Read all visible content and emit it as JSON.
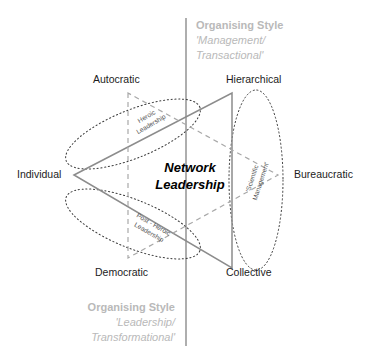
{
  "diagram": {
    "center_title_line1": "Network",
    "center_title_line2": "Leadership",
    "axis_top": {
      "title": "Organising Style",
      "sub_line1": "'Management/",
      "sub_line2": "Transactional'"
    },
    "axis_bottom": {
      "title": "Organising Style",
      "sub_line1": "'Leadership/",
      "sub_line2": "Transformational'"
    },
    "corner_labels": {
      "top_left": "Autocratic",
      "top_right": "Hierarchical",
      "left": "Individual",
      "right": "Bureaucratic",
      "bottom_left": "Democratic",
      "bottom_right": "Collective"
    },
    "region_labels": {
      "upper": {
        "line1": "Heroic",
        "line2": "Leadership"
      },
      "lower": {
        "line1": "Post - Heroic",
        "line2": "Leadership"
      },
      "right": {
        "line1": "'Scientific",
        "line2": "Management'"
      }
    },
    "colors": {
      "solid_triangle": "#8c8c8c",
      "dashed_triangle": "#a8a8a8",
      "dotted_ellipse": "#3a3a3a",
      "axis_line": "#9a9a9a",
      "axis_text": "#b9b9b9",
      "label_text": "#1c1c1c",
      "background": "#ffffff"
    }
  }
}
